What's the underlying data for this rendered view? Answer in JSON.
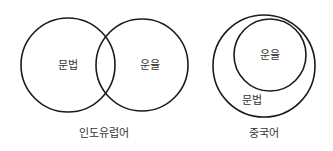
{
  "diagrams": [
    {
      "caption": "인도유럽어",
      "relation": "overlapping",
      "sets": [
        {
          "label": "문법"
        },
        {
          "label": "운율"
        }
      ]
    },
    {
      "caption": "중국어",
      "relation": "nested",
      "sets": [
        {
          "label": "문법",
          "role": "outer"
        },
        {
          "label": "운율",
          "role": "inner"
        }
      ]
    }
  ],
  "colors": {
    "stroke": "#1a1a1a",
    "text": "#333333",
    "background": "#ffffff"
  }
}
